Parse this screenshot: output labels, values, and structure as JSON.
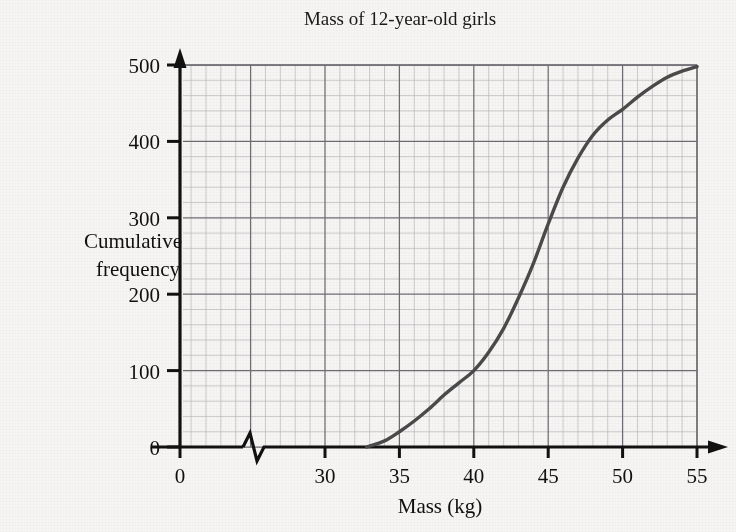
{
  "chart_data": {
    "type": "line",
    "title": "Mass of 12-year-old girls",
    "xlabel": "Mass (kg)",
    "ylabel_line1": "Cumulative",
    "ylabel_line2": "frequency",
    "xlim": [
      30,
      55
    ],
    "ylim": [
      0,
      500
    ],
    "x_ticks": [
      0,
      30,
      35,
      40,
      45,
      50,
      55
    ],
    "x_tick_labels": [
      "0",
      "30",
      "35",
      "40",
      "45",
      "50",
      "55"
    ],
    "y_ticks": [
      0,
      100,
      200,
      300,
      400,
      500
    ],
    "y_tick_labels": [
      "0",
      "100",
      "200",
      "300",
      "400",
      "500"
    ],
    "axis_break": true,
    "axis_break_label": "zigzag-break",
    "grid": true,
    "grid_minor_per_major": 5,
    "legend": null,
    "series": [
      {
        "name": "Cumulative frequency",
        "color": "#4a4a4a",
        "x": [
          32.8,
          34,
          35,
          36,
          37,
          38,
          39,
          40,
          41,
          42,
          43,
          44,
          45,
          46,
          47,
          48,
          49,
          50,
          51,
          52,
          53,
          54,
          55
        ],
        "values": [
          0,
          8,
          20,
          34,
          50,
          68,
          84,
          100,
          124,
          155,
          195,
          240,
          292,
          340,
          378,
          408,
          428,
          442,
          458,
          472,
          484,
          492,
          498
        ]
      }
    ],
    "annotations": []
  },
  "colors": {
    "page_background": "#f6f5f3",
    "axis": "#111111",
    "grid_minor": "#b9b7bd",
    "grid_major": "#6e6d73",
    "curve": "#4a4a4a",
    "text": "#121212"
  }
}
